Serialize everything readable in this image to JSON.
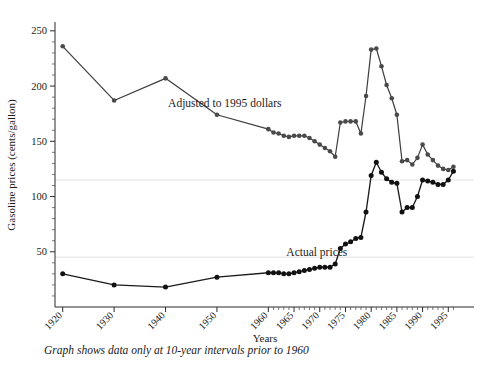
{
  "figure": {
    "note": "Graph shows data only at 10-year intervals prior to 1960",
    "background_color": "#ffffff"
  },
  "chart_data": {
    "type": "line",
    "title": "",
    "xlabel": "Years",
    "ylabel": "Gasoline prices (cents/gallon)",
    "xlim": [
      1918.5,
      1996.5
    ],
    "ylim": [
      0,
      258
    ],
    "ytick_labels": [
      "50",
      "100",
      "150",
      "200",
      "250"
    ],
    "yticks": [
      50,
      100,
      150,
      200,
      250
    ],
    "y_minor_step": 10,
    "xtick_labels": [
      "1920",
      "1930",
      "1940",
      "1950",
      "1960",
      "1965",
      "1970",
      "1975",
      "1980",
      "1985",
      "1990",
      "1995"
    ],
    "xticks": [
      1920,
      1930,
      1940,
      1950,
      1960,
      1965,
      1970,
      1975,
      1980,
      1985,
      1990,
      1995
    ],
    "x_minor_step": 1,
    "grid": "horizontal-faint",
    "gridline_values": [
      45,
      115
    ],
    "gridline_color": "#ebebeb",
    "legend_position": "inline-annotations",
    "series": [
      {
        "name": "Adjusted to 1995 dollars",
        "annotation": "Adjusted to 1995 dollars",
        "annotation_x": 1940.5,
        "annotation_y": 181,
        "color": "#4a4a4a",
        "x": [
          1920,
          1930,
          1940,
          1950,
          1960,
          1961,
          1962,
          1963,
          1964,
          1965,
          1966,
          1967,
          1968,
          1969,
          1970,
          1971,
          1972,
          1973,
          1974,
          1975,
          1976,
          1977,
          1978,
          1979,
          1980,
          1981,
          1982,
          1983,
          1984,
          1985,
          1986,
          1987,
          1988,
          1989,
          1990,
          1991,
          1992,
          1993,
          1994,
          1995,
          1996
        ],
        "y": [
          236,
          187,
          207,
          174,
          161,
          158,
          157,
          155,
          154,
          155,
          155,
          155,
          153,
          150,
          147,
          144,
          141,
          136,
          167,
          168,
          168,
          168,
          157,
          191,
          233,
          234,
          218,
          201,
          189,
          174,
          132,
          133,
          129,
          135,
          147,
          138,
          133,
          128,
          125,
          124,
          127
        ]
      },
      {
        "name": "Actual prices",
        "annotation": "Actual prices",
        "annotation_x": 1963.5,
        "annotation_y": 46,
        "color": "#111111",
        "x": [
          1920,
          1930,
          1940,
          1950,
          1960,
          1961,
          1962,
          1963,
          1964,
          1965,
          1966,
          1967,
          1968,
          1969,
          1970,
          1971,
          1972,
          1973,
          1974,
          1975,
          1976,
          1977,
          1978,
          1979,
          1980,
          1981,
          1982,
          1983,
          1984,
          1985,
          1986,
          1987,
          1988,
          1989,
          1990,
          1991,
          1992,
          1993,
          1994,
          1995,
          1996
        ],
        "y": [
          30,
          20,
          18,
          27,
          31,
          31,
          31,
          30,
          30,
          31,
          32,
          33,
          34,
          35,
          36,
          36,
          36,
          39,
          53,
          57,
          59,
          62,
          63,
          86,
          119,
          131,
          122,
          116,
          113,
          112,
          86,
          90,
          90,
          100,
          115,
          114,
          113,
          111,
          111,
          115,
          123
        ]
      }
    ]
  }
}
